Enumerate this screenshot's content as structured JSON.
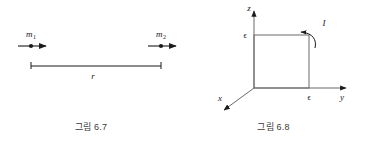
{
  "figures": [
    {
      "id": "fig-6-7",
      "caption": "그림 6.7",
      "labels": {
        "mass1": "m",
        "mass1_sub": "1",
        "mass2": "m",
        "mass2_sub": "2",
        "distance": "r"
      },
      "description": "두 질점 m1 과 m2 가 거리 r 만큼 떨어져 있는 그림",
      "stroke_color": "#1a1a1a"
    },
    {
      "id": "fig-6-8",
      "caption": "그림 6.8",
      "labels": {
        "axis_z": "z",
        "axis_y": "y",
        "axis_x": "x",
        "current": "I",
        "epsilon_z": "ϵ",
        "epsilon_y": "ϵ"
      },
      "description": "y-z 평면 위의 한 변이 입실론인 정사각형 전류 고리와 전류 I",
      "stroke_color": "#1a1a1a"
    }
  ]
}
